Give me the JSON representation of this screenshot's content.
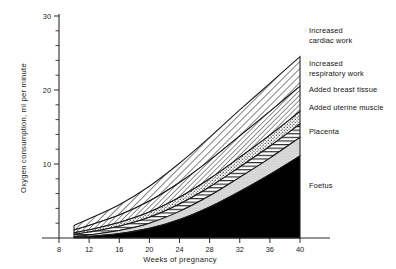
{
  "chart_data": {
    "type": "area",
    "title": "",
    "xlabel": "Weeks of pregnancy",
    "ylabel": "Oxygen consumption, ml per minute",
    "xlim": [
      6,
      41
    ],
    "ylim": [
      0,
      30
    ],
    "x_ticks": [
      8,
      12,
      16,
      20,
      24,
      28,
      32,
      36,
      40
    ],
    "y_ticks": [
      10,
      20,
      30
    ],
    "y_minor_ticks": [
      2,
      4,
      6,
      8,
      12,
      14,
      16,
      18,
      22,
      24,
      26,
      28
    ],
    "grid": false,
    "legend_position": "right-of-plot-inline",
    "stacked": true,
    "x": [
      10,
      12,
      16,
      20,
      24,
      28,
      32,
      36,
      40
    ],
    "series": [
      {
        "name": "Foetus",
        "pattern": "solid-black",
        "values": [
          0.1,
          0.2,
          0.6,
          1.3,
          2.5,
          4.2,
          6.3,
          8.6,
          11.1
        ]
      },
      {
        "name": "Placenta",
        "pattern": "light-stipple",
        "values": [
          0.1,
          0.2,
          0.4,
          0.7,
          1.1,
          1.5,
          1.9,
          2.2,
          2.5
        ]
      },
      {
        "name": "Added uterine muscle",
        "pattern": "horizontal-lines",
        "values": [
          0.3,
          0.4,
          0.6,
          0.8,
          1.0,
          1.2,
          1.4,
          1.6,
          1.8
        ]
      },
      {
        "name": "Added breast tissue",
        "pattern": "dotted",
        "values": [
          0.2,
          0.3,
          0.5,
          0.7,
          0.9,
          1.1,
          1.3,
          1.5,
          1.7
        ]
      },
      {
        "name": "Increased respiratory work",
        "pattern": "diagonal-hatch-fine",
        "values": [
          0.4,
          0.6,
          1.0,
          1.5,
          2.0,
          2.5,
          2.9,
          3.2,
          3.4
        ]
      },
      {
        "name": "Increased cardiac work",
        "pattern": "diagonal-hatch",
        "values": [
          0.6,
          0.9,
          1.4,
          2.0,
          2.6,
          3.1,
          3.5,
          3.8,
          4.0
        ]
      }
    ],
    "totals": [
      1.7,
      2.6,
      4.5,
      7.0,
      10.1,
      13.6,
      17.3,
      20.9,
      24.5
    ],
    "annotations": [
      {
        "text": "Increased cardiac work",
        "series": "Increased cardiac work"
      },
      {
        "text": "Increased respiratory work",
        "series": "Increased respiratory work"
      },
      {
        "text": "Added breast tissue",
        "series": "Added breast tissue"
      },
      {
        "text": "Added uterine muscle",
        "series": "Added uterine muscle"
      },
      {
        "text": "Placenta",
        "series": "Placenta"
      },
      {
        "text": "Foetus",
        "series": "Foetus"
      }
    ]
  },
  "axes": {
    "y_title": "Oxygen consumption, ml per minute",
    "x_title": "Weeks of pregnancy",
    "x_tick_labels": [
      "8",
      "12",
      "16",
      "20",
      "24",
      "28",
      "32",
      "36",
      "40"
    ],
    "y_tick_labels": [
      "10",
      "20",
      "30"
    ]
  },
  "legend": {
    "items": [
      {
        "line1": "Increased",
        "line2": "cardiac work",
        "label": "Increased cardiac work"
      },
      {
        "line1": "Increased",
        "line2": "respiratory work",
        "label": "Increased respiratory work"
      },
      {
        "line1": "Added breast tissue",
        "line2": "",
        "label": "Added breast tissue"
      },
      {
        "line1": "Added uterine muscle",
        "line2": "",
        "label": "Added uterine muscle"
      },
      {
        "line1": "Placenta",
        "line2": "",
        "label": "Placenta"
      },
      {
        "line1": "Foetus",
        "line2": "",
        "label": "Foetus"
      }
    ]
  },
  "colors": {
    "ink": "#1a1a1a",
    "foetus_fill": "#000000",
    "placenta_fill": "#d8d8d8",
    "background": "#ffffff"
  }
}
